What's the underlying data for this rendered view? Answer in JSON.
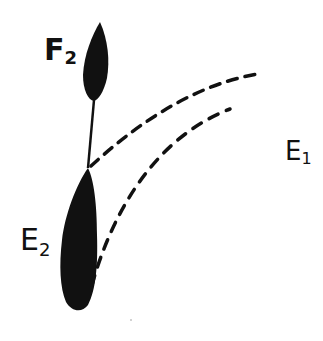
{
  "diagram": {
    "style": "hand-drawn ink sketch",
    "ink_color": "#111111",
    "background": "#ffffff",
    "nodes": [
      {
        "id": "F2",
        "label_main": "F",
        "label_sub": "2",
        "shape": "filled-leaf"
      },
      {
        "id": "E2",
        "label_main": "E",
        "label_sub": "2",
        "shape": "filled-elongated-blob"
      }
    ],
    "edges": [
      {
        "from": "F2",
        "to": "E2",
        "style": "solid",
        "description": "stem connecting F2 to E2"
      }
    ],
    "paths": [
      {
        "id": "upper-dashed",
        "style": "dashed",
        "description": "curve from F2-E2 junction toward upper right"
      },
      {
        "id": "lower-dashed",
        "style": "dashed",
        "description": "curve from E2 base toward upper right"
      }
    ],
    "free_labels": [
      {
        "id": "E1",
        "label_main": "E",
        "label_sub": "1"
      }
    ]
  }
}
